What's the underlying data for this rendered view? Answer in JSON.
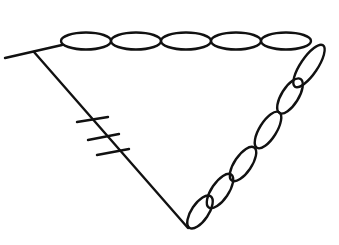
{
  "diagram": {
    "type": "structural-sketch",
    "stroke_color": "#111111",
    "background": "#ffffff",
    "stem": {
      "x1": 5,
      "y1": 58,
      "x2": 62,
      "y2": 45
    },
    "left_edge": {
      "x1": 34,
      "y1": 52,
      "x2": 188,
      "y2": 228
    },
    "tick_marks": [
      {
        "x1": 77,
        "y1": 122,
        "x2": 108,
        "y2": 117
      },
      {
        "x1": 88,
        "y1": 140,
        "x2": 119,
        "y2": 134
      },
      {
        "x1": 97,
        "y1": 155,
        "x2": 129,
        "y2": 149
      }
    ],
    "top_chain": {
      "count": 5,
      "ellipses": [
        {
          "cx": 86,
          "cy": 41,
          "rx": 25,
          "ry": 8.5
        },
        {
          "cx": 136,
          "cy": 41,
          "rx": 25,
          "ry": 8.5
        },
        {
          "cx": 186,
          "cy": 41,
          "rx": 25,
          "ry": 8.5
        },
        {
          "cx": 236,
          "cy": 41,
          "rx": 25,
          "ry": 8.5
        },
        {
          "cx": 286,
          "cy": 41,
          "rx": 25,
          "ry": 8.5
        }
      ]
    },
    "right_chain": {
      "count": 6,
      "ellipses": [
        {
          "cx": 309,
          "cy": 66,
          "rx": 25,
          "ry": 8.5,
          "angle": -56
        },
        {
          "cx": 290,
          "cy": 96,
          "rx": 20,
          "ry": 8.5,
          "angle": -58
        },
        {
          "cx": 268,
          "cy": 130,
          "rx": 21,
          "ry": 8.5,
          "angle": -58
        },
        {
          "cx": 243,
          "cy": 164,
          "rx": 20,
          "ry": 8.5,
          "angle": -56
        },
        {
          "cx": 220,
          "cy": 191,
          "rx": 20,
          "ry": 8.5,
          "angle": -56
        },
        {
          "cx": 200,
          "cy": 212,
          "rx": 19,
          "ry": 8.5,
          "angle": -56
        }
      ]
    }
  }
}
